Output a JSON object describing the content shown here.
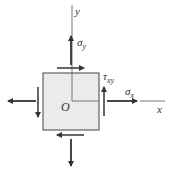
{
  "diagram": {
    "labels": {
      "y_axis": "y",
      "x_axis": "x",
      "origin": "O",
      "sigma_y": "σ",
      "sigma_y_sub": "y",
      "sigma_x": "σ",
      "sigma_x_sub": "x",
      "tau_xy": "τ",
      "tau_xy_sub": "xy"
    },
    "colors": {
      "element_fill": "#ebebeb",
      "stroke": "#333333"
    }
  }
}
